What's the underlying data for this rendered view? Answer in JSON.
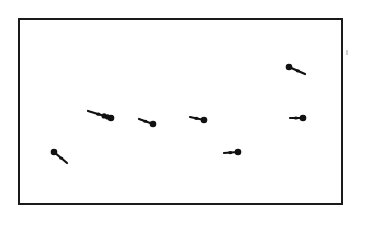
{
  "diagram": {
    "type": "particle-motion",
    "frame": {
      "x": 18,
      "y": 18,
      "width": 325,
      "height": 187,
      "stroke": "#1a1a1a"
    },
    "particle_color": "#111111",
    "particles": [
      {
        "head": [
          54,
          152
        ],
        "tail": [
          67,
          163
        ],
        "heads": 1
      },
      {
        "head": [
          111,
          118
        ],
        "tail": [
          88,
          111
        ],
        "heads": 3
      },
      {
        "head": [
          153,
          124
        ],
        "tail": [
          139,
          119
        ],
        "heads": 1
      },
      {
        "head": [
          204,
          120
        ],
        "tail": [
          190,
          117
        ],
        "heads": 1
      },
      {
        "head": [
          238,
          152
        ],
        "tail": [
          224,
          153
        ],
        "heads": 1
      },
      {
        "head": [
          289,
          67
        ],
        "tail": [
          305,
          74
        ],
        "heads": 1
      },
      {
        "head": [
          303,
          118
        ],
        "tail": [
          290,
          118
        ],
        "heads": 1
      }
    ]
  }
}
